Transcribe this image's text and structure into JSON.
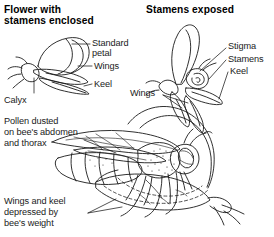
{
  "figure": {
    "kind": "botanical-line-diagram",
    "ink_color": "#1a1a1a",
    "background_color": "#ffffff"
  },
  "panels": {
    "left": {
      "title_line1": "Flower with",
      "title_line2": "stamens enclosed"
    },
    "right": {
      "title": "Stamens exposed"
    }
  },
  "labels": {
    "standard_petal_line1": "Standard",
    "standard_petal_line2": "petal",
    "wings_left": "Wings",
    "keel_left": "Keel",
    "calyx": "Calyx",
    "stigma": "Stigma",
    "stamens": "Stamens",
    "keel_right": "Keel",
    "wings_right": "Wings",
    "pollen_line1": "Pollen dusted",
    "pollen_line2": "on bee's abdomen",
    "pollen_line3": "and thorax",
    "depressed_line1": "Wings and keel",
    "depressed_line2": "depressed by",
    "depressed_line3": "bee's weight"
  }
}
